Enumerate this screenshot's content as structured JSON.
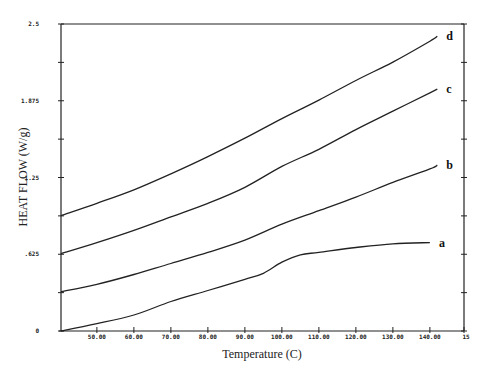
{
  "chart_data": {
    "type": "line",
    "title": "",
    "xlabel": "Temperature (C)",
    "ylabel": "HEAT FLOW (W/g)",
    "xlim": [
      40.3,
      150
    ],
    "ylim": [
      0,
      2.5
    ],
    "grid": false,
    "legend": "inline curve labels at right end",
    "x_ticks": [
      50,
      60,
      70,
      80,
      90,
      100,
      110,
      120,
      130,
      140,
      150
    ],
    "x_tick_labels": [
      "50.00",
      "60.00",
      "70.00",
      "80.00",
      "90.00",
      "100.00",
      "110.00",
      "120.00",
      "130.00",
      "140.00",
      "15"
    ],
    "y_ticks": [
      0,
      0.625,
      1.25,
      1.875,
      2.5
    ],
    "y_tick_labels": [
      "0",
      ".625",
      "1.25",
      "1.875",
      "2.5"
    ],
    "y_minor_ticks": [
      0.3125,
      0.9375,
      1.5625,
      2.1875
    ],
    "series": [
      {
        "name": "a",
        "x": [
          40.3,
          50,
          60,
          70,
          80,
          90,
          95,
          100,
          105,
          110,
          120,
          130,
          140
        ],
        "y": [
          0.0,
          0.06,
          0.13,
          0.24,
          0.33,
          0.42,
          0.47,
          0.56,
          0.62,
          0.64,
          0.68,
          0.71,
          0.72
        ]
      },
      {
        "name": "b",
        "x": [
          40.3,
          50,
          60,
          70,
          80,
          90,
          100,
          110,
          120,
          130,
          140,
          142
        ],
        "y": [
          0.32,
          0.38,
          0.46,
          0.55,
          0.64,
          0.74,
          0.87,
          0.98,
          1.09,
          1.21,
          1.32,
          1.35
        ]
      },
      {
        "name": "c",
        "x": [
          40.3,
          50,
          60,
          70,
          80,
          90,
          100,
          110,
          120,
          130,
          140,
          142
        ],
        "y": [
          0.63,
          0.72,
          0.82,
          0.93,
          1.04,
          1.17,
          1.34,
          1.48,
          1.64,
          1.79,
          1.94,
          1.97
        ]
      },
      {
        "name": "d",
        "x": [
          40.3,
          50,
          60,
          70,
          80,
          90,
          100,
          110,
          120,
          130,
          140,
          142
        ],
        "y": [
          0.94,
          1.04,
          1.15,
          1.28,
          1.42,
          1.57,
          1.73,
          1.88,
          2.04,
          2.19,
          2.36,
          2.4
        ]
      }
    ]
  }
}
